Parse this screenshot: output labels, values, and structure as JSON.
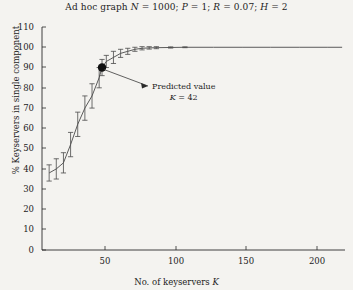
{
  "figure": {
    "title": "Ad hoc graph N = 1000; P = 1; R = 0.07; H = 2",
    "title_parts": {
      "lead": "Ad hoc graph ",
      "n_sym": "N",
      "n_eq": " = 1000; ",
      "p_sym": "P",
      "p_eq": " = 1; ",
      "r_sym": "R",
      "r_eq": " = 0.07; ",
      "h_sym": "H",
      "h_eq": " = 2"
    },
    "background_color": "#f4f3f0",
    "ink_color": "#1c1c1c",
    "curve_color": "#4a4a4a",
    "marker_color": "#101010"
  },
  "annotation": {
    "line1": "Predicted value",
    "line2_sym": "K",
    "line2_val": " = 42",
    "target_k": 42,
    "target_pct": 90
  },
  "chart_data": {
    "type": "line",
    "title": "Ad hoc graph N = 1000; P = 1; R = 0.07; H = 2",
    "xlabel": "No. of keyservers K",
    "ylabel": "% Keyservers in single component",
    "xlim": [
      0,
      212
    ],
    "ylim": [
      0,
      110
    ],
    "xticks": [
      50,
      100,
      150,
      200
    ],
    "yticks": [
      0,
      10,
      20,
      30,
      40,
      50,
      60,
      70,
      80,
      90,
      100,
      110
    ],
    "grid": false,
    "legend": null,
    "series": [
      {
        "name": "% keyservers in single component",
        "has_error_bars": true,
        "x": [
          5,
          10,
          15,
          20,
          25,
          30,
          35,
          40,
          42,
          45,
          50,
          55,
          60,
          65,
          70,
          75,
          80,
          90,
          100,
          120,
          140,
          160,
          180,
          200,
          210
        ],
        "y": [
          38,
          40,
          43,
          52,
          62,
          70,
          76,
          85,
          90,
          93,
          95,
          97,
          98,
          99,
          99.5,
          99.7,
          99.8,
          99.9,
          100,
          100,
          100,
          100,
          100,
          100,
          100
        ],
        "yerr": [
          4,
          5,
          5,
          6,
          6,
          6,
          6,
          5,
          4,
          3,
          3,
          2,
          1.5,
          1,
          0.8,
          0.6,
          0.5,
          0.3,
          0.2,
          0,
          0,
          0,
          0,
          0,
          0
        ]
      }
    ],
    "highlight_point": {
      "x": 42,
      "y": 90,
      "label": "Predicted value K = 42"
    }
  },
  "axes": {
    "y_tick_labels": [
      "110",
      "100",
      "90",
      "80",
      "70",
      "60",
      "50",
      "40",
      "30",
      "20",
      "10",
      "0"
    ],
    "x_tick_labels": [
      "50",
      "100",
      "150",
      "200"
    ],
    "x_axis_label_lead": "No. of keyservers ",
    "x_axis_label_sym": "K",
    "y_axis_label": "% Keyservers in single component"
  }
}
